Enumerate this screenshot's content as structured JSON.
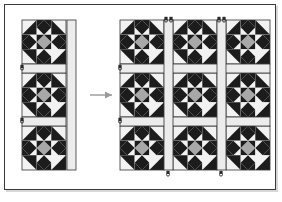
{
  "figure": {
    "background_color": "#ffffff",
    "frame_color": "#3a3a3a",
    "frame_shadow_color": "#d8d8d8"
  },
  "palette": {
    "dark_patch": "#1c1c1c",
    "medium_patch": "#a8a8a8",
    "light_patch": "#f2f2f2",
    "sashing_fill": "#ececec",
    "outline": "#333333",
    "arrow_color": "#9a9a9a",
    "pin_color": "#2a2a2a"
  },
  "left_group": {
    "label": "block column before joining",
    "x": 22,
    "y": 20,
    "block_size": 44,
    "sash_width": 9,
    "rows": 3,
    "columns": 1,
    "vertical_sashing_count": 1,
    "horizontal_sashing_count": 2,
    "pin_marks": 2
  },
  "arrow": {
    "label": "assembly direction arrow",
    "x1": 90,
    "y1": 95,
    "x2": 116,
    "y2": 95,
    "head_size": 5
  },
  "right_group": {
    "label": "joined block grid after sashing",
    "x": 120,
    "y": 20,
    "block_size": 44,
    "sash_width": 9,
    "rows": 3,
    "columns": 3,
    "vertical_sashing_count": 2,
    "horizontal_sashing_count": 2,
    "pin_marks": 6
  },
  "block_pattern": {
    "name": "nine-patch diagonal diamond block",
    "grid": 3,
    "cells": [
      [
        "corner-dark-triangle",
        "diamond-dark",
        "corner-dark-triangle"
      ],
      [
        "diamond-dark",
        "diamond-medium",
        "diamond-dark"
      ],
      [
        "corner-dark-triangle",
        "diamond-dark",
        "corner-dark-triangle"
      ]
    ],
    "center_color_name": "medium_patch",
    "diamond_color_name": "dark_patch",
    "ground_color_name": "light_patch"
  }
}
